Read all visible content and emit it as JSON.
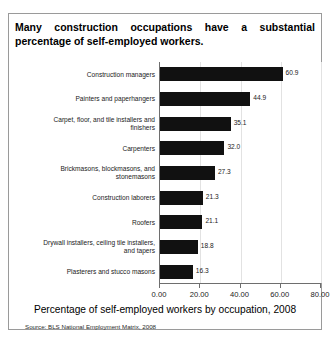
{
  "title": {
    "line1": "Many construction occupations have a substantial",
    "line2": "percentage of self-employed workers."
  },
  "axis_title": "Percentage of self-employed workers by occupation, 2008",
  "source": "Source: BLS National Employment Matrix, 2008",
  "chart_data": {
    "type": "bar",
    "orientation": "horizontal",
    "title": "Many construction occupations have a substantial percentage of self-employed workers.",
    "xlabel": "Percentage of self-employed workers by occupation, 2008",
    "ylabel": "",
    "xlim": [
      0,
      80
    ],
    "xticks": [
      0,
      20,
      40,
      60,
      80
    ],
    "xtick_labels": [
      "0.00",
      "20.00",
      "40.00",
      "60.00",
      "80.00"
    ],
    "grid": true,
    "legend": false,
    "bar_color": "#111111",
    "categories": [
      "Construction managers",
      "Painters and paperhangers",
      "Carpet, floor, and tile installers and finishers",
      "Carpenters",
      "Brickmasons, blockmasons, and stonemasons",
      "Construction laborers",
      "Roofers",
      "Drywall installers, ceiling tile installers, and tapers",
      "Plasterers and stucco masons"
    ],
    "category_lines": [
      [
        "Construction managers"
      ],
      [
        "Painters and paperhangers"
      ],
      [
        "Carpet, floor, and tile installers and",
        "finishers"
      ],
      [
        "Carpenters"
      ],
      [
        "Brickmasons, blockmasons, and",
        "stonemasons"
      ],
      [
        "Construction laborers"
      ],
      [
        "Roofers"
      ],
      [
        "Drywall installers, ceiling tile installers,",
        "and tapers"
      ],
      [
        "Plasterers and stucco masons"
      ]
    ],
    "values": [
      60.9,
      44.9,
      35.1,
      32.0,
      27.3,
      21.3,
      21.1,
      18.8,
      16.3
    ],
    "value_labels": [
      "60.9",
      "44.9",
      "35.1",
      "32.0",
      "27.3",
      "21.3",
      "21.1",
      "18.8",
      "16.3"
    ]
  }
}
